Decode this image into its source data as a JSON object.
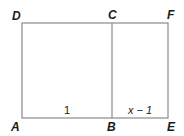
{
  "diagram": {
    "type": "golden-rectangle-figure",
    "stroke_color": "#8a8a8a",
    "points": {
      "D": "D",
      "C": "C",
      "F": "F",
      "A": "A",
      "B": "B",
      "E": "E"
    },
    "segments": {
      "AB": "1",
      "BE": "x − 1"
    }
  }
}
